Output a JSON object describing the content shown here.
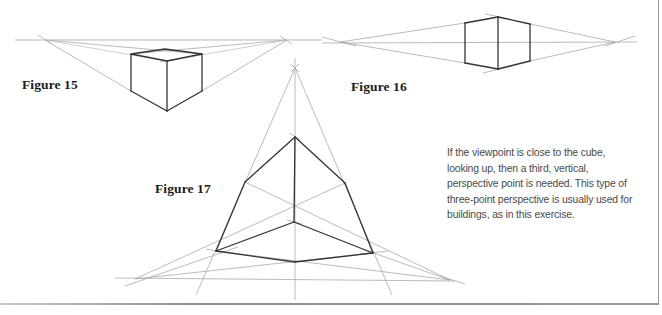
{
  "page": {
    "clipped_header_text": "",
    "figures": [
      {
        "id": "fig15",
        "label": "Figure 15",
        "type": "two-point perspective cube, viewed from above"
      },
      {
        "id": "fig16",
        "label": "Figure 16",
        "type": "two-point perspective cube at eye level"
      },
      {
        "id": "fig17",
        "label": "Figure 17",
        "type": "three-point perspective cube, looking up"
      }
    ],
    "caption": "If the viewpoint is close to the cube, looking up, then a third, vertical, perspective point is needed. This type of three-point perspective is usually used for buildings, as in this exercise.",
    "colors": {
      "background": "#ffffff",
      "cube_edges": "#333333",
      "guide_lines": "#a9a9a9",
      "label_text": "#1b1b1b",
      "caption_text": "#4a4a4a",
      "frame": "#9a9a9a"
    }
  }
}
